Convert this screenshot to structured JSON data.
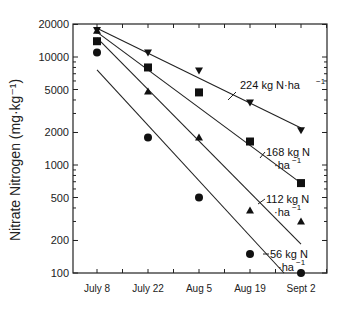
{
  "chart_data": {
    "type": "scatter",
    "title": "",
    "xlabel": "",
    "ylabel": "Nitrate Nitrogen (mg·kg⁻¹)",
    "yscale": "log",
    "ylim": [
      100,
      20000
    ],
    "yticks": [
      100,
      200,
      500,
      1000,
      2000,
      5000,
      10000,
      20000
    ],
    "ytick_labels": [
      "100",
      "200",
      "500",
      "1000",
      "2000",
      "5000",
      "10000",
      "20000"
    ],
    "categories": [
      "July 8",
      "July 22",
      "Aug 5",
      "Aug 19",
      "Sept 2"
    ],
    "grid": false,
    "legend": "inline annotations next to regression lines",
    "series": [
      {
        "name": "224 kg N·ha⁻¹",
        "marker": "triangle-down",
        "values": [
          17800,
          11000,
          7500,
          3800,
          2100
        ],
        "fit_line": {
          "start": 18500,
          "end": 2200
        },
        "annotation": {
          "line1": "224 kg N·ha",
          "sup": "−1",
          "line2": ""
        }
      },
      {
        "name": "168 kg N·ha⁻¹",
        "marker": "square",
        "values": [
          14000,
          8000,
          4700,
          1650,
          680
        ],
        "fit_line": {
          "start": 17000,
          "end": 680
        },
        "annotation": {
          "line1": "168 kg N",
          "sup": "−1",
          "line2": "·ha"
        }
      },
      {
        "name": "112 kg N·ha⁻¹",
        "marker": "triangle-up",
        "values": [
          17500,
          4800,
          1800,
          380,
          300
        ],
        "fit_line": {
          "start": 15000,
          "end": 185
        },
        "annotation": {
          "line1": "112 kg N",
          "sup": "−1",
          "line2": "·ha"
        }
      },
      {
        "name": "56 kg N·ha⁻¹",
        "marker": "circle",
        "values": [
          11000,
          1800,
          500,
          150,
          100
        ],
        "fit_line": {
          "start": 7600,
          "end": 100
        },
        "annotation": {
          "line1": "56 kg N",
          "sup": "−1",
          "line2": "·ha"
        }
      }
    ]
  }
}
